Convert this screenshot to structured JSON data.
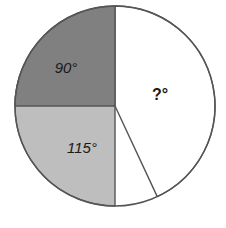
{
  "chart_data": {
    "type": "pie",
    "title": "",
    "subtitle": "",
    "xlabel": "",
    "ylabel": "",
    "legend": "none",
    "grid": false,
    "units": "degrees",
    "total_degrees": 360,
    "center": {
      "x": 115,
      "y": 106
    },
    "radius": 100,
    "outline_color": "#555555",
    "background_color": "#ffffff",
    "start_angle_deg": 0,
    "direction": "clockwise",
    "categories": [
      "?",
      "115",
      "90"
    ],
    "values": [
      155,
      115,
      90
    ],
    "slices": [
      {
        "name": "unknown-slice",
        "label": "?°",
        "value": 155,
        "is_unknown": true,
        "color": "#ffffff",
        "start_deg": 0,
        "end_deg": 155,
        "label_x": 160,
        "label_y": 100,
        "label_style": "bold"
      },
      {
        "name": "light-gray-slice",
        "label": "115°",
        "value": 115,
        "is_unknown": false,
        "color": "#bebebe",
        "start_deg": 180,
        "end_deg": 295,
        "label_x": 82,
        "label_y": 153,
        "label_style": "italic"
      },
      {
        "name": "dark-gray-slice",
        "label": "90°",
        "value": 90,
        "is_unknown": false,
        "color": "#808080",
        "start_deg": 270,
        "end_deg": 360,
        "label_x": 66,
        "label_y": 73,
        "label_style": "italic"
      }
    ]
  }
}
